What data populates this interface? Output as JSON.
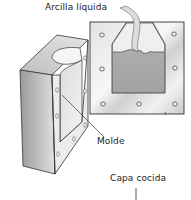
{
  "diagram": {
    "labels": {
      "liquid_clay": "Arcilla líquida",
      "mold": "Molde",
      "fired_layer": "Capa cocida"
    },
    "colors": {
      "background": "#ffffff",
      "outline": "#333333",
      "face_light": "#f0f0f0",
      "face_mid": "#c8c8c8",
      "face_dark": "#9a9a9a",
      "cavity": "#a8a8a8",
      "slip": "#d6d6d6"
    }
  }
}
